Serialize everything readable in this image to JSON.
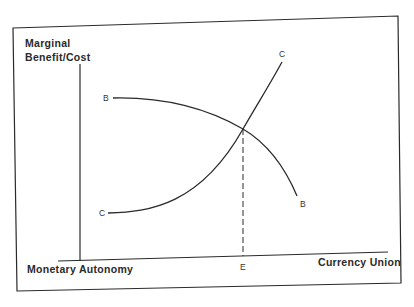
{
  "figure": {
    "y_axis_label_line1": "Marginal",
    "y_axis_label_line2": "Benefit/Cost",
    "x_axis_left_label": "Monetary Autonomy",
    "x_axis_right_label": "Currency Union",
    "equilibrium_label": "E",
    "curves": [
      {
        "name": "benefit",
        "start_label": "B",
        "end_label": "B",
        "description": "downward-sloping marginal benefit curve"
      },
      {
        "name": "cost",
        "start_label": "C",
        "end_label": "C",
        "description": "upward-sloping marginal cost curve"
      }
    ],
    "colors": {
      "line": "#2a2a2a",
      "background": "#ffffff"
    }
  }
}
